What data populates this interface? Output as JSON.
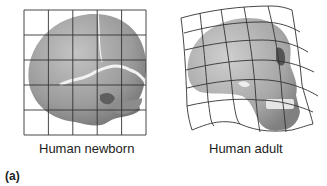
{
  "figure": {
    "panel_label": "(a)",
    "panels": [
      {
        "id": "newborn",
        "caption": "Human newborn",
        "grid": "regular 5x5 square grid"
      },
      {
        "id": "adult",
        "caption": "Human adult",
        "grid": "transformed (warped) 5x5 grid"
      }
    ]
  }
}
